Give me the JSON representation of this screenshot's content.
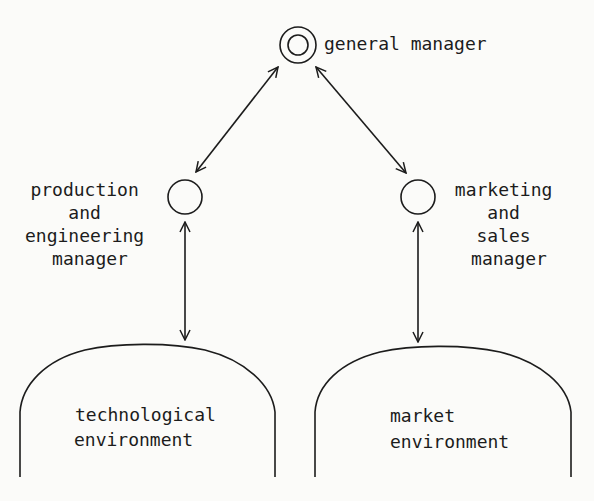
{
  "diagram": {
    "nodes": {
      "general_manager": {
        "label": "general manager"
      },
      "production_manager": {
        "lines": [
          "production",
          "and",
          "engineering",
          "manager"
        ]
      },
      "marketing_manager": {
        "lines": [
          "marketing",
          "and",
          "sales",
          "manager"
        ]
      },
      "technological_environment": {
        "lines": [
          "technological",
          "environment"
        ]
      },
      "market_environment": {
        "lines": [
          "market",
          "environment"
        ]
      }
    },
    "edges": [
      {
        "from": "general_manager",
        "to": "production_manager",
        "type": "bidirectional"
      },
      {
        "from": "general_manager",
        "to": "marketing_manager",
        "type": "bidirectional"
      },
      {
        "from": "production_manager",
        "to": "technological_environment",
        "type": "bidirectional"
      },
      {
        "from": "marketing_manager",
        "to": "market_environment",
        "type": "bidirectional"
      }
    ],
    "colors": {
      "ink": "#1c1c1c",
      "background": "#fbfbf9"
    }
  }
}
